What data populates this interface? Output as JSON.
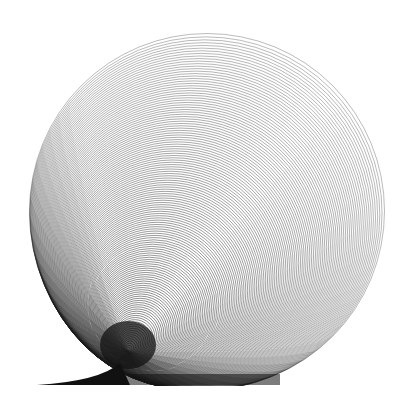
{
  "artwork": {
    "title": "Concentric circles converging to lower-left with tail",
    "background": "#ffffff",
    "stroke_color": "#1a1a1a",
    "outer_circle": {
      "cx": 207,
      "cy": 211,
      "r": 177
    },
    "focus_point": {
      "x": 128,
      "y": 350
    },
    "ring_count": 140,
    "tail": {
      "start_x": 37,
      "start_y": 385,
      "tip_join_x": 120,
      "tip_join_y": 363
    },
    "bottom_edge_y": 385
  }
}
